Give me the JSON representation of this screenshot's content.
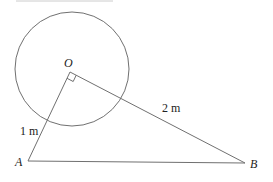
{
  "diagram": {
    "colors": {
      "stroke": "#707070",
      "text": "#222222",
      "top_fragment": "#cccccc"
    },
    "circle": {
      "cx": 72,
      "cy": 69,
      "r": 57
    },
    "points": {
      "O": {
        "label": "O",
        "x": 70,
        "y": 72
      },
      "A": {
        "label": "A",
        "x": 28,
        "y": 161
      },
      "B": {
        "label": "B",
        "x": 245,
        "y": 163
      }
    },
    "labels": {
      "O": "O",
      "A": "A",
      "B": "B",
      "OA_length": "1 m",
      "OB_length": "2 m"
    },
    "right_angle_marker": {
      "at": "O",
      "size": 7
    }
  }
}
